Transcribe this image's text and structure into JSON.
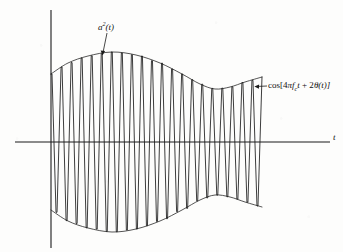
{
  "figure": {
    "background_color": "#fdfdfc",
    "ink_color": "#1a1a1a"
  },
  "axes": {
    "x_label": "t",
    "x_axis_y": 142,
    "x_axis_start": 15,
    "x_axis_end": 330,
    "y_axis_x": 51,
    "y_axis_top": 10,
    "y_axis_bottom": 248,
    "grid": false
  },
  "annotations": [
    {
      "name": "envelope-label",
      "text_parts": {
        "base": "a",
        "sup": "2",
        "arg": "(t)"
      },
      "x": 98,
      "y": 21,
      "leader": {
        "x1": 107,
        "y1": 33,
        "x2": 102,
        "y2": 56
      }
    },
    {
      "name": "carrier-label",
      "text_parts": {
        "fn": "cos[4",
        "pi": "π",
        "f": "f",
        "sub": "c",
        "t1": "t",
        "plus": " + 2",
        "theta": "θ",
        "arg": "(t)]"
      },
      "x": 268,
      "y": 81,
      "leader": {
        "x1": 266,
        "y1": 86,
        "x2": 254,
        "y2": 86
      }
    }
  ],
  "chart_data": {
    "type": "line",
    "title": "",
    "xlabel": "t",
    "ylabel": "",
    "grid": false,
    "legend_position": "none",
    "xlim": [
      0,
      1
    ],
    "ylim": [
      -1.15,
      1.15
    ],
    "series": [
      {
        "name": "cos[4πf_c t + 2θ(t)]",
        "description": "Dense double-frequency carrier oscillation filling the envelope",
        "cycles": 21,
        "x_start_px": 51,
        "x_end_px": 262
      },
      {
        "name": "a²(t)",
        "description": "Slowly varying squared envelope, upper branch",
        "control_points_px": [
          [
            51,
            74
          ],
          [
            68,
            63
          ],
          [
            88,
            56
          ],
          [
            112,
            52
          ],
          [
            136,
            55
          ],
          [
            160,
            63
          ],
          [
            182,
            74
          ],
          [
            200,
            84
          ],
          [
            215,
            89
          ],
          [
            230,
            87
          ],
          [
            245,
            82
          ],
          [
            262,
            77
          ]
        ]
      },
      {
        "name": "-a²(t)",
        "description": "Slowly varying squared envelope, lower branch (mirror of upper)",
        "control_points_px": [
          [
            51,
            210
          ],
          [
            68,
            221
          ],
          [
            88,
            228
          ],
          [
            112,
            232
          ],
          [
            136,
            229
          ],
          [
            160,
            221
          ],
          [
            182,
            210
          ],
          [
            200,
            200
          ],
          [
            215,
            195
          ],
          [
            230,
            197
          ],
          [
            245,
            202
          ],
          [
            262,
            207
          ]
        ]
      }
    ]
  }
}
